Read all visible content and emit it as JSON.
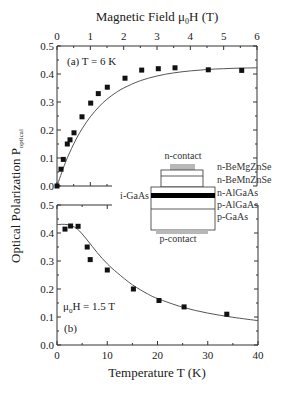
{
  "chart_data": [
    {
      "panel": "a",
      "type": "scatter",
      "title": "",
      "annotation": "(a)  T = 6 K",
      "xlabel": "Magnetic Field μ0H (T)",
      "xlabel_parts": {
        "main": "Magnetic Field μ",
        "sub": "0",
        "rest": "H (T)"
      },
      "ylabel": "Optical Polarization P_optical",
      "xlim": [
        0,
        6
      ],
      "ylim": [
        0,
        0.5
      ],
      "x_ticks": [
        "0",
        "1",
        "2",
        "3",
        "4",
        "5",
        "6"
      ],
      "y_ticks": [
        "0.0",
        "0.1",
        "0.2",
        "0.3",
        "0.4",
        "0.5"
      ],
      "x_axis_position": "top",
      "grid": false,
      "series": [
        {
          "name": "data",
          "marker": "square",
          "x": [
            0.0,
            0.12,
            0.19,
            0.31,
            0.39,
            0.51,
            0.75,
            1.01,
            1.24,
            1.51,
            2.04,
            2.54,
            3.04,
            3.54,
            4.54,
            5.54
          ],
          "y": [
            0.0,
            0.06,
            0.095,
            0.15,
            0.165,
            0.19,
            0.247,
            0.296,
            0.33,
            0.353,
            0.385,
            0.414,
            0.419,
            0.422,
            0.415,
            0.413
          ]
        },
        {
          "name": "fit",
          "style": "line",
          "x": [
            0,
            0.25,
            0.5,
            0.75,
            1.0,
            1.25,
            1.5,
            1.75,
            2.0,
            2.5,
            3.0,
            3.5,
            4.0,
            4.5,
            5.0,
            5.5,
            6.0
          ],
          "y": [
            0.0,
            0.083,
            0.15,
            0.204,
            0.247,
            0.282,
            0.31,
            0.332,
            0.35,
            0.376,
            0.393,
            0.404,
            0.411,
            0.416,
            0.419,
            0.421,
            0.422
          ]
        }
      ]
    },
    {
      "panel": "b",
      "type": "scatter",
      "title": "",
      "annotation_field": {
        "main": "μ",
        "sub": "0",
        "rest": "H = 1.5 T"
      },
      "annotation_label": "(b)",
      "xlabel": "Temperature  T (K)",
      "ylabel": "Optical Polarization P_optical",
      "xlim": [
        0,
        40
      ],
      "ylim": [
        0,
        0.5
      ],
      "x_ticks": [
        "0",
        "10",
        "20",
        "30",
        "40"
      ],
      "y_ticks": [
        "0.0",
        "0.1",
        "0.2",
        "0.3",
        "0.4",
        "0.5"
      ],
      "grid": false,
      "series": [
        {
          "name": "data",
          "marker": "square",
          "x": [
            1.6,
            2.7,
            4.2,
            6.0,
            6.6,
            10.0,
            15.2,
            20.3,
            25.3,
            33.8
          ],
          "y": [
            0.414,
            0.425,
            0.424,
            0.35,
            0.305,
            0.268,
            0.2,
            0.159,
            0.136,
            0.11
          ]
        },
        {
          "name": "fit",
          "style": "line",
          "x": [
            0,
            2,
            4,
            6,
            8,
            10,
            12,
            15,
            18,
            20,
            25,
            30,
            35,
            40
          ],
          "y": [
            0.43,
            0.43,
            0.415,
            0.375,
            0.33,
            0.29,
            0.258,
            0.215,
            0.183,
            0.166,
            0.135,
            0.114,
            0.099,
            0.087
          ]
        }
      ]
    }
  ],
  "figure": {
    "ylabel_main": "Optical Polarization  P",
    "ylabel_sub": "optical",
    "top_xlabel_main": "Magnetic Field μ",
    "top_xlabel_sub": "0",
    "top_xlabel_rest": "H (T)",
    "bottom_xlabel": "Temperature  T (K)",
    "panel_a_annotation": "(a)  T = 6 K",
    "panel_b_field_main": "μ",
    "panel_b_field_sub": "0",
    "panel_b_field_rest": "H = 1.5 T",
    "panel_b_label": "(b)"
  },
  "inset": {
    "top_label": "n-contact",
    "bottom_label": "p-contact",
    "left_label": "i-GaAs",
    "layers": [
      "n-BeMgZnSe",
      "n-BeMnZnSe",
      "n-AlGaAs",
      "p-AlGaAs",
      "p-GaAs"
    ],
    "colors": {
      "contact": "#b8b8b8",
      "active": "#000000",
      "line": "#333333"
    }
  },
  "colors": {
    "axis": "#333333",
    "marker": "#111111",
    "fit": "#555555"
  }
}
